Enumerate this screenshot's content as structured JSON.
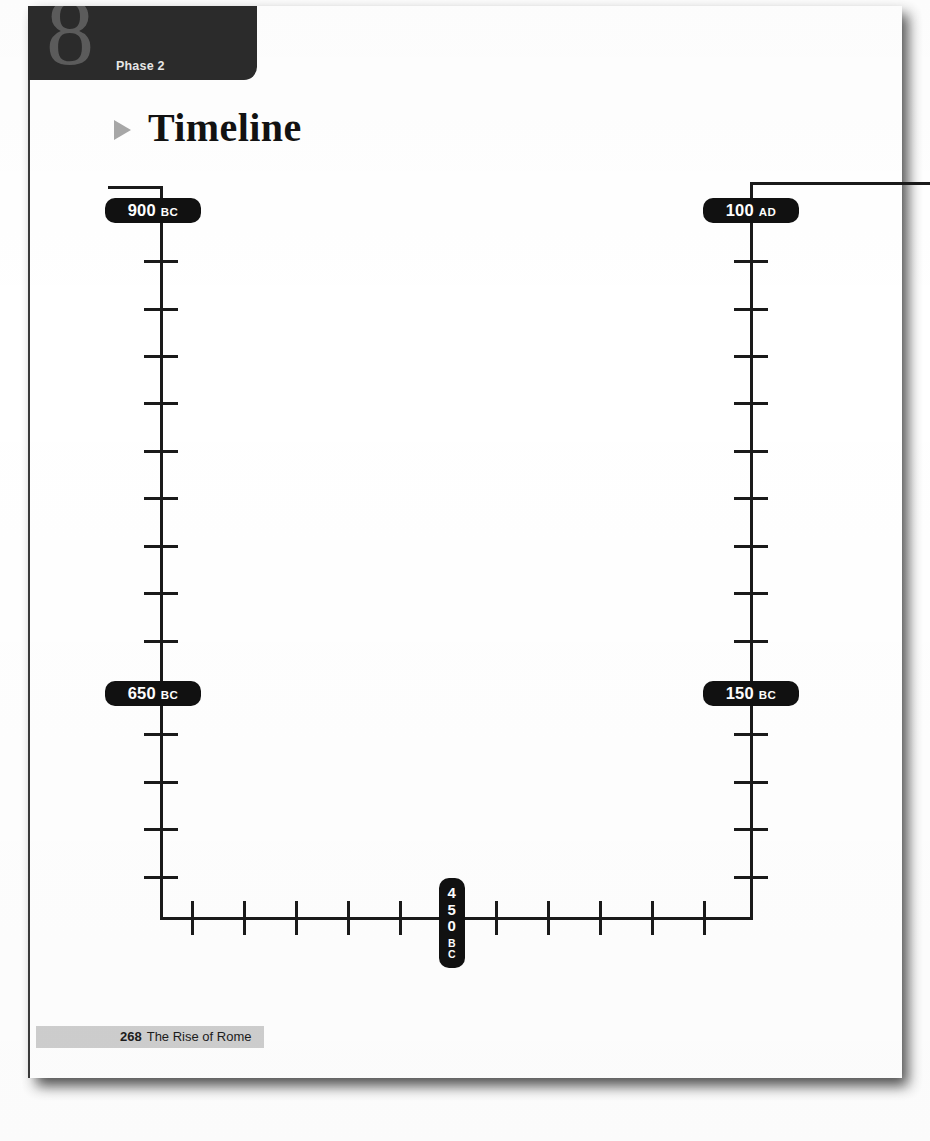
{
  "page": {
    "chapter_number": "8",
    "phase_label": "Phase 2",
    "title": "Timeline",
    "bullet_icon": "triangle-right-icon",
    "footer_page_number": "268",
    "footer_title": "The Rise of Rome",
    "colors": {
      "ink": "#1a1a1a",
      "header_block": "#2b2b2b",
      "chapter_number": "#5c5c5c",
      "pill": "#111111",
      "bullet": "#a8a8a8",
      "footer_bar": "#cfcfcf",
      "paper": "#ffffff"
    }
  },
  "chart_data": {
    "type": "timeline",
    "title": "Timeline",
    "orientation": "serpentine-u-shape",
    "note": "A U-shaped (boustrophedon) timeline: time runs down the left column, left-to-right along the bottom, then up the right column.",
    "labels": [
      {
        "id": "label-900-bc",
        "year": "900",
        "era": "BC",
        "text": "900 BC",
        "position": "top-left",
        "orientation": "horizontal"
      },
      {
        "id": "label-650-bc",
        "year": "650",
        "era": "BC",
        "text": "650 BC",
        "position": "mid-left",
        "orientation": "horizontal"
      },
      {
        "id": "label-450-bc",
        "year": "450",
        "era": "BC",
        "text": "450 BC",
        "position": "bottom-center",
        "orientation": "vertical"
      },
      {
        "id": "label-150-bc",
        "year": "150",
        "era": "BC",
        "text": "150 BC",
        "position": "mid-right",
        "orientation": "horizontal"
      },
      {
        "id": "label-100-ad",
        "year": "100",
        "era": "AD",
        "text": "100 AD",
        "position": "top-right",
        "orientation": "horizontal"
      }
    ],
    "axes": [
      {
        "id": "left-axis",
        "direction": "vertical",
        "start_label": "900 BC",
        "end_label": "450 BC",
        "tick_count": 14
      },
      {
        "id": "bottom-axis",
        "direction": "horizontal",
        "start_label": "450 BC",
        "end_label": "450 BC",
        "tick_count": 10
      },
      {
        "id": "right-axis",
        "direction": "vertical",
        "start_label": "100 AD",
        "end_label": "150 BC",
        "tick_count": 14
      }
    ],
    "ticks_left": [
      260,
      308,
      355,
      402,
      450,
      497,
      545,
      592,
      640,
      733,
      781,
      828,
      876
    ],
    "ticks_right": [
      260,
      308,
      355,
      402,
      450,
      497,
      545,
      592,
      640,
      733,
      781,
      828,
      876
    ],
    "ticks_bottom": [
      191,
      243,
      295,
      347,
      399,
      495,
      547,
      599,
      651,
      703
    ]
  }
}
